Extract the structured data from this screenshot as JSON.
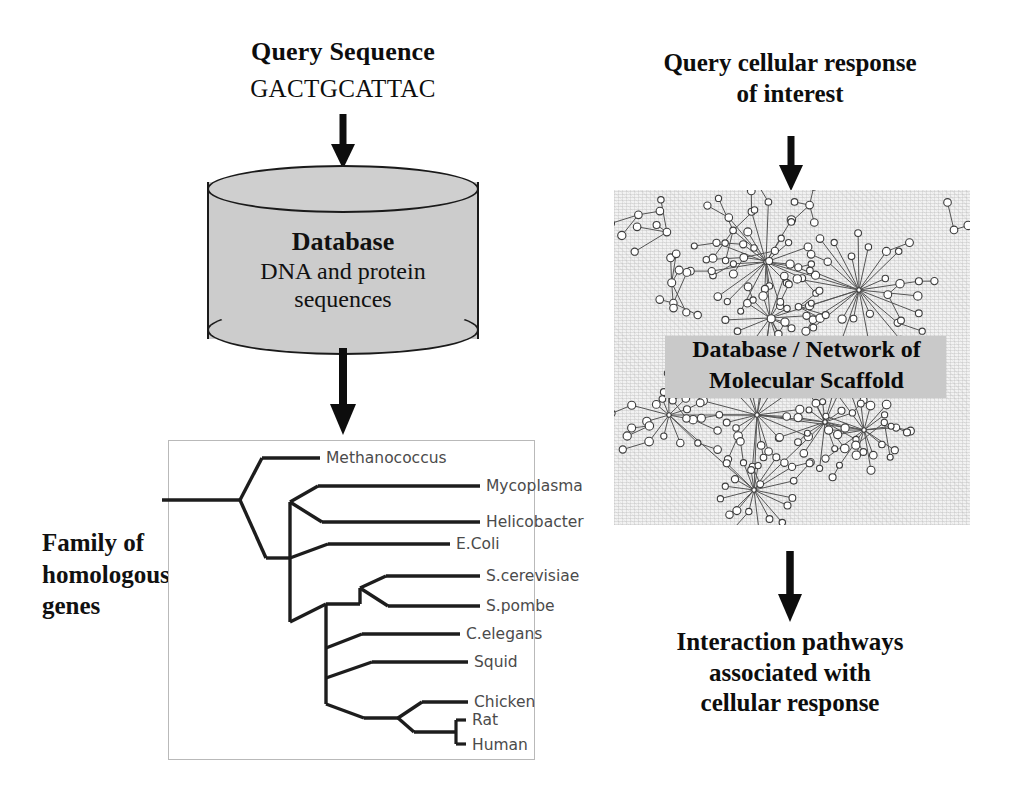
{
  "left_column": {
    "query_title": "Query Sequence",
    "query_value": "GACTGCATTAC",
    "arrow_to_database": "down-arrow",
    "database": {
      "title": "Database",
      "subtitle_line1": "DNA and protein",
      "subtitle_line2": "sequences"
    },
    "arrow_to_tree": "down-arrow",
    "family_label_line1": "Family of",
    "family_label_line2": "homologous",
    "family_label_line3": "genes",
    "tree": {
      "type": "phylogenetic-tree",
      "leaves": [
        "Methanococcus",
        "Mycoplasma",
        "Helicobacter",
        "E.Coli",
        "S.cerevisiae",
        "S.pombe",
        "C.elegans",
        "Squid",
        "Chicken",
        "Rat",
        "Human"
      ]
    }
  },
  "right_column": {
    "query_title_line1": "Query cellular response",
    "query_title_line2": "of interest",
    "arrow_to_network": "down-arrow",
    "network": {
      "band_line1": "Database / Network of",
      "band_line2": "Molecular Scaffold",
      "description": "scale-free-network-graph"
    },
    "arrow_to_result": "down-arrow",
    "result_line1": "Interaction pathways",
    "result_line2": "associated with",
    "result_line3": "cellular response"
  },
  "colors": {
    "ink": "#0d0d0d",
    "cylinder_fill": "#cccccc",
    "cylinder_stroke": "#1a1a1a",
    "network_background": "#f2f2f2",
    "band_fill": "#c9c9c9",
    "tree_frame_border": "#b9b9b9",
    "tree_label_color": "#4b4b4b"
  }
}
